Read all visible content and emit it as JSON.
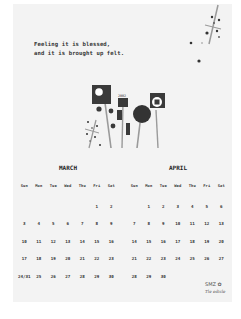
{
  "quote": {
    "line1": "Feeling it is blessed,",
    "line2": "and it is brought up felt."
  },
  "illustration": {
    "label": "2002"
  },
  "weekdays": [
    "Sun",
    "Mon",
    "Tue",
    "Wed",
    "Thu",
    "Fri",
    "Sat"
  ],
  "months": [
    {
      "name": "MARCH",
      "weeks": [
        [
          "",
          "",
          "",
          "",
          "",
          "1",
          "2"
        ],
        [
          "3",
          "4",
          "5",
          "6",
          "7",
          "8",
          "9"
        ],
        [
          "10",
          "11",
          "12",
          "13",
          "14",
          "15",
          "16"
        ],
        [
          "17",
          "18",
          "19",
          "20",
          "21",
          "22",
          "23"
        ],
        [
          "24/31",
          "25",
          "26",
          "27",
          "28",
          "29",
          "30"
        ]
      ]
    },
    {
      "name": "APRIL",
      "weeks": [
        [
          "",
          "1",
          "2",
          "3",
          "4",
          "5",
          "6"
        ],
        [
          "7",
          "8",
          "9",
          "10",
          "11",
          "12",
          "13"
        ],
        [
          "14",
          "15",
          "16",
          "17",
          "18",
          "19",
          "20"
        ],
        [
          "21",
          "22",
          "23",
          "24",
          "25",
          "26",
          "27"
        ],
        [
          "28",
          "29",
          "30",
          "",
          "",
          "",
          ""
        ]
      ]
    }
  ],
  "brand": {
    "logo": "SMZ",
    "subtitle": "Tle edicle"
  },
  "colors": {
    "page_bg": "#f3f3f3",
    "ink": "#333333",
    "art_dark": "#3a3a3a",
    "art_stem": "#9a9a9a"
  }
}
